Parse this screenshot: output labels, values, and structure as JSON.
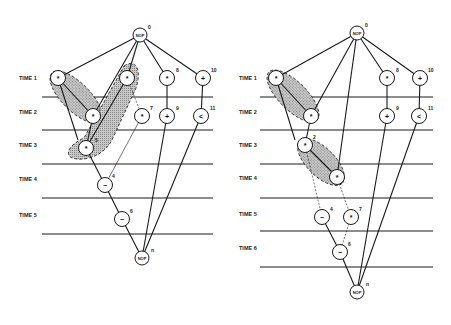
{
  "figure": {
    "colors": {
      "line": "#1a1a1a",
      "shade": "#b5b5b5",
      "background": "#ffffff"
    },
    "diagrams": [
      {
        "id": "left",
        "time_labels": [
          "TIME 1",
          "TIME 2",
          "TIME 3",
          "TIME 4",
          "TIME 5"
        ],
        "top_nop": {
          "label": "NOP",
          "index": "0"
        },
        "bottom_nop": {
          "label": "NOP",
          "index": "n"
        },
        "nodes": [
          {
            "op": "*",
            "index": "1"
          },
          {
            "op": "*",
            "index": "2"
          },
          {
            "op": "*",
            "index": "8"
          },
          {
            "op": "+",
            "index": "10"
          },
          {
            "op": "*",
            "index": "3"
          },
          {
            "op": "*",
            "index": "7"
          },
          {
            "op": "+",
            "index": "9"
          },
          {
            "op": "<",
            "index": "11"
          },
          {
            "op": "*",
            "index": "5"
          },
          {
            "op": "−",
            "index": "4"
          },
          {
            "op": "−",
            "index": "6"
          }
        ]
      },
      {
        "id": "right",
        "time_labels": [
          "TIME 1",
          "TIME 2",
          "TIME 3",
          "TIME 4",
          "TIME 5",
          "TIME 6"
        ],
        "top_nop": {
          "label": "NOP",
          "index": "0"
        },
        "bottom_nop": {
          "label": "NOP",
          "index": "n"
        },
        "nodes": [
          {
            "op": "*",
            "index": "1"
          },
          {
            "op": "*",
            "index": "3"
          },
          {
            "op": "*",
            "index": "2"
          },
          {
            "op": "*",
            "index": "5"
          },
          {
            "op": "*",
            "index": "8"
          },
          {
            "op": "+",
            "index": "10"
          },
          {
            "op": "+",
            "index": "9"
          },
          {
            "op": "<",
            "index": "11"
          },
          {
            "op": "−",
            "index": "4"
          },
          {
            "op": "*",
            "index": "7"
          },
          {
            "op": "−",
            "index": "6"
          }
        ]
      }
    ]
  }
}
